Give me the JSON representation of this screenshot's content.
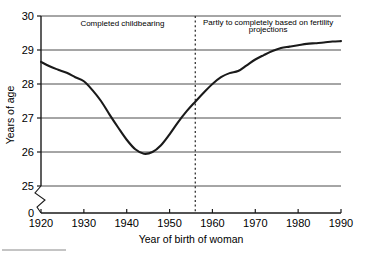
{
  "chart_data": {
    "type": "line",
    "title": "",
    "xlabel": "Year of birth of woman",
    "ylabel": "Years of age",
    "xlim": [
      1920,
      1990
    ],
    "ylim": [
      25,
      30
    ],
    "y_axis_break": true,
    "y_break_label": "0",
    "grid": true,
    "grid_axis": "y",
    "legend": "none",
    "xticks": [
      1920,
      1930,
      1940,
      1950,
      1960,
      1970,
      1980,
      1990
    ],
    "xtick_labels": [
      "1920",
      "1930",
      "1940",
      "1950",
      "1960",
      "1970",
      "1980",
      "1990"
    ],
    "yticks": [
      25,
      26,
      27,
      28,
      29,
      30
    ],
    "ytick_labels": [
      "25",
      "26",
      "27",
      "28",
      "29",
      "30"
    ],
    "series": [
      {
        "name": "Mean age at childbearing",
        "color": "#1a1a1a",
        "x": [
          1920,
          1922,
          1924,
          1926,
          1928,
          1930,
          1932,
          1934,
          1936,
          1938,
          1940,
          1942,
          1944,
          1946,
          1948,
          1950,
          1952,
          1954,
          1956,
          1958,
          1960,
          1962,
          1964,
          1966,
          1968,
          1970,
          1972,
          1974,
          1976,
          1978,
          1980,
          1982,
          1984,
          1986,
          1988,
          1990
        ],
        "values": [
          28.65,
          28.52,
          28.42,
          28.33,
          28.2,
          28.08,
          27.82,
          27.5,
          27.1,
          26.72,
          26.36,
          26.08,
          25.95,
          26.0,
          26.2,
          26.52,
          26.88,
          27.2,
          27.48,
          27.75,
          28.0,
          28.2,
          28.32,
          28.38,
          28.55,
          28.72,
          28.85,
          28.97,
          29.06,
          29.1,
          29.14,
          29.18,
          29.2,
          29.22,
          29.25,
          29.26
        ]
      }
    ],
    "annotations": [
      {
        "name": "completed-childbearing-label",
        "text": "Completed childbearing",
        "x": 1939,
        "y": 29.72
      },
      {
        "name": "projection-label-line1",
        "text": "Partly to completely based on fertility",
        "x": 1973,
        "y": 29.75
      },
      {
        "name": "projection-label-line2",
        "text": "projections",
        "x": 1973,
        "y": 29.52
      }
    ],
    "reference_lines": [
      {
        "name": "projection-divider",
        "orientation": "vertical",
        "x": 1956,
        "style": "dotted",
        "color": "#333333"
      }
    ]
  },
  "footnote_rule": {
    "present": true
  }
}
